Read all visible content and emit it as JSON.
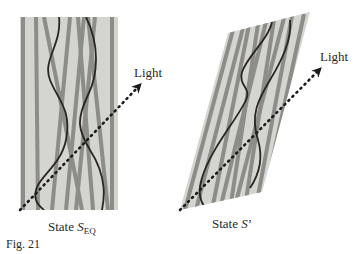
{
  "figure": {
    "caption": "Fig. 21",
    "colors": {
      "background": "#ffffff",
      "panel_fill": "#d4d4d0",
      "bar": "#8c8c88",
      "curve": "#2b2422",
      "arrow": "#1a1a1a",
      "text": "#2a2a2a"
    }
  },
  "panels": [
    {
      "id": "left",
      "state_prefix": "State ",
      "state_symbol": "S",
      "state_subscript": "EQ",
      "light_label": "Light"
    },
    {
      "id": "right",
      "state_prefix": "State ",
      "state_symbol": "S",
      "state_suffix": "’",
      "light_label": "Light"
    }
  ]
}
